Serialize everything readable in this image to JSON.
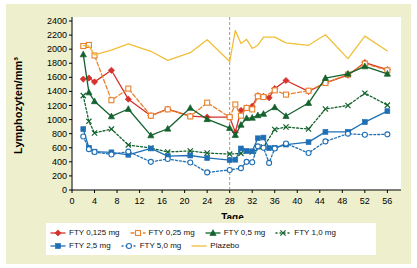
{
  "chart_data": {
    "type": "line",
    "title": "",
    "xlabel": "Tage",
    "ylabel": "Lymphozyten/mm³",
    "xlim": [
      0,
      57
    ],
    "ylim": [
      0,
      2400
    ],
    "xticks": [
      0,
      4,
      8,
      12,
      16,
      20,
      24,
      28,
      32,
      36,
      40,
      44,
      48,
      52,
      56
    ],
    "yticks": [
      0,
      200,
      400,
      600,
      800,
      1000,
      1200,
      1400,
      1600,
      1800,
      2000,
      2200,
      2400
    ],
    "grid": false,
    "legend_position": "bottom",
    "annotations": [
      {
        "type": "vline",
        "x": 28,
        "style": "dashed",
        "color": "#9a9a8a"
      }
    ],
    "series": [
      {
        "name": "FTY 0,125 mg",
        "color": "#d6312b",
        "marker": "diamond-filled",
        "line": "solid",
        "x": [
          2,
          3,
          4,
          7,
          10,
          14,
          17,
          21,
          24,
          28,
          29,
          30,
          31,
          32,
          33,
          34,
          35,
          36,
          38,
          42,
          45,
          49,
          52,
          56
        ],
        "y": [
          1575,
          1590,
          1535,
          1700,
          1290,
          1055,
          1150,
          1050,
          1035,
          1035,
          820,
          1130,
          1165,
          1190,
          1340,
          1330,
          1310,
          1440,
          1555,
          1400,
          1520,
          1630,
          1810,
          1710
        ]
      },
      {
        "name": "FTY 0,25 mg",
        "color": "#e8822c",
        "marker": "square-open",
        "line": "dashed",
        "x": [
          2,
          3,
          4,
          7,
          10,
          14,
          17,
          21,
          24,
          28,
          29,
          30,
          31,
          32,
          33,
          34,
          36,
          38,
          42,
          45,
          49,
          52,
          56
        ],
        "y": [
          2045,
          2060,
          1910,
          1275,
          1440,
          1055,
          1145,
          1045,
          1240,
          1035,
          1215,
          1055,
          1165,
          1145,
          1330,
          1320,
          1415,
          1355,
          1410,
          1520,
          1640,
          1795,
          1700
        ]
      },
      {
        "name": "FTY 0,5 mg",
        "color": "#14622d",
        "marker": "triangle-filled",
        "line": "solid",
        "x": [
          2,
          3,
          4,
          7,
          10,
          14,
          17,
          21,
          24,
          28,
          29,
          30,
          31,
          32,
          33,
          34,
          36,
          38,
          42,
          45,
          49,
          52,
          56
        ],
        "y": [
          1925,
          1385,
          1260,
          1045,
          1150,
          775,
          870,
          1165,
          1005,
          880,
          780,
          925,
          1020,
          1025,
          1060,
          1080,
          1175,
          1050,
          1235,
          1590,
          1650,
          1755,
          1650
        ]
      },
      {
        "name": "FTY 1,0 mg",
        "color": "#14622d",
        "marker": "x",
        "line": "dotted",
        "x": [
          2,
          3,
          4,
          7,
          10,
          14,
          17,
          21,
          24,
          28,
          30,
          32,
          34,
          36,
          38,
          42,
          45,
          49,
          52,
          56
        ],
        "y": [
          1340,
          975,
          810,
          865,
          640,
          595,
          540,
          555,
          525,
          510,
          520,
          540,
          610,
          860,
          895,
          865,
          1150,
          1200,
          1375,
          1205
        ]
      },
      {
        "name": "FTY 2,5 mg",
        "color": "#1f6fb5",
        "marker": "square-filled",
        "line": "solid",
        "x": [
          2,
          3,
          4,
          7,
          10,
          14,
          17,
          21,
          24,
          28,
          29,
          30,
          31,
          32,
          33,
          34,
          35,
          36,
          38,
          42,
          45,
          49,
          52,
          56
        ],
        "y": [
          865,
          600,
          545,
          535,
          500,
          590,
          480,
          490,
          455,
          425,
          430,
          590,
          555,
          550,
          735,
          745,
          595,
          600,
          645,
          680,
          825,
          825,
          965,
          1120
        ]
      },
      {
        "name": "FTY 5,0 mg",
        "color": "#1f6fb5",
        "marker": "circle-open",
        "line": "dotted",
        "x": [
          2,
          3,
          4,
          7,
          10,
          14,
          17,
          21,
          24,
          28,
          30,
          31,
          32,
          33,
          34,
          35,
          36,
          38,
          42,
          45,
          49,
          52,
          56
        ],
        "y": [
          760,
          580,
          540,
          505,
          545,
          400,
          440,
          390,
          250,
          285,
          310,
          400,
          395,
          620,
          600,
          385,
          590,
          660,
          525,
          690,
          800,
          785,
          790
        ]
      },
      {
        "name": "Plazebo",
        "color": "#f0bf3a",
        "marker": "none",
        "line": "solid",
        "x": [
          2,
          3,
          4,
          7,
          10,
          14,
          17,
          21,
          24,
          28,
          29,
          30,
          31,
          32,
          33,
          34,
          36,
          38,
          42,
          45,
          49,
          52,
          56
        ],
        "y": [
          2050,
          2045,
          1920,
          1985,
          2075,
          1970,
          1840,
          1950,
          2135,
          1825,
          2265,
          2080,
          2140,
          2010,
          2055,
          2170,
          2170,
          2090,
          2055,
          2205,
          1865,
          2185,
          1975
        ]
      }
    ]
  },
  "legend": {
    "rows": [
      [
        {
          "label": "FTY 0,125 mg",
          "series": 0
        },
        {
          "label": "FTY 0,25 mg",
          "series": 1
        },
        {
          "label": "FTY 0,5 mg",
          "series": 2
        },
        {
          "label": "FTY 1,0 mg",
          "series": 3
        }
      ],
      [
        {
          "label": "FTY 2,5 mg",
          "series": 4
        },
        {
          "label": "FTY 5,0 mg",
          "series": 5
        },
        {
          "label": "Plazebo",
          "series": 6
        }
      ]
    ]
  },
  "colors": {
    "background": "#eef0cd",
    "plot_background": "#ffffff",
    "axis": "#000000",
    "vline": "#9a9a8a"
  }
}
